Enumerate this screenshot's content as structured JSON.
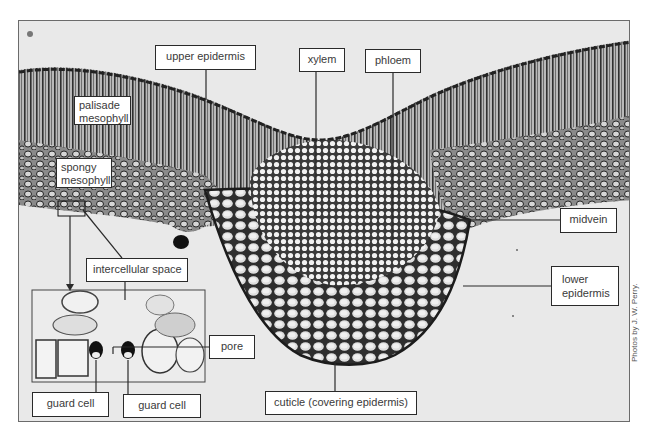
{
  "figure": {
    "colors": {
      "background": "#e9e9e9",
      "frame": "#6b6b6b",
      "label_border": "#2a2a2a",
      "label_text": "#3a3a3a",
      "tissue_dark": "#2b2b2b"
    },
    "labels": {
      "upper_epidermis": "upper epidermis",
      "xylem": "xylem",
      "phloem": "phloem",
      "palisade_line1": "palisade",
      "palisade_line2": "mesophyll",
      "spongy_line1": "spongy",
      "spongy_line2": "mesophyll",
      "midvein": "midvein",
      "lower_epidermis_line1": "lower",
      "lower_epidermis_line2": "epidermis",
      "intercellular_space": "intercellular space",
      "pore": "pore",
      "guard_cell_left": "guard cell",
      "guard_cell_right": "guard cell",
      "cuticle": "cuticle (covering epidermis)"
    },
    "inset": {
      "description": "magnified view of stoma with two guard cells and pore"
    },
    "credit": "Photos by J. W. Perry."
  }
}
